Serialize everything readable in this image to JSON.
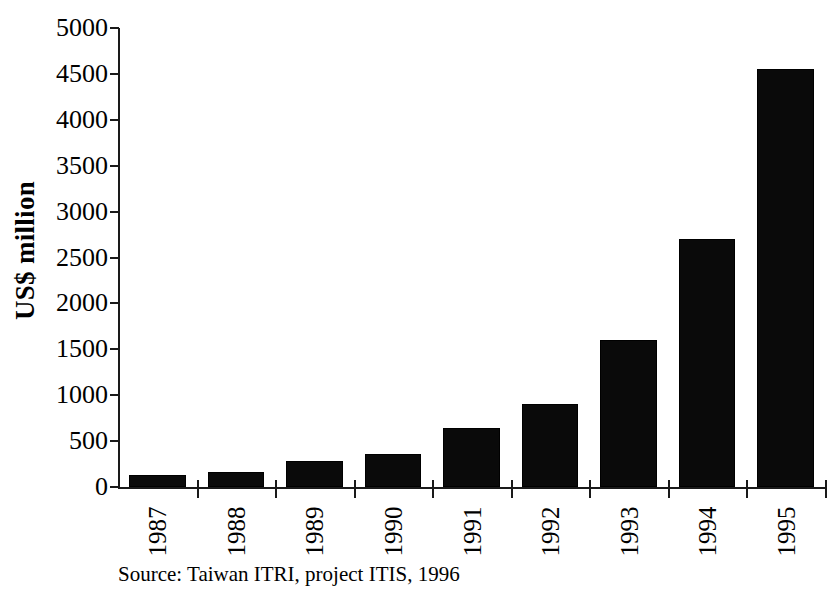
{
  "chart_data": {
    "type": "bar",
    "title": "",
    "subtitle": "",
    "xlabel": "",
    "ylabel": "US$ million",
    "categories": [
      "1987",
      "1988",
      "1989",
      "1990",
      "1991",
      "1992",
      "1993",
      "1994",
      "1995"
    ],
    "values": [
      130,
      165,
      285,
      360,
      645,
      900,
      1600,
      2700,
      4550
    ],
    "series": [
      {
        "name": "",
        "values": [
          130,
          165,
          285,
          360,
          645,
          900,
          1600,
          2700,
          4550
        ]
      }
    ],
    "ylim": [
      0,
      5000
    ],
    "ytick_values": [
      0,
      500,
      1000,
      1500,
      2000,
      2500,
      3000,
      3500,
      4000,
      4500,
      5000
    ],
    "ytick_labels": [
      "0",
      "500",
      "1000",
      "1500",
      "2000",
      "2500",
      "3000",
      "3500",
      "4000",
      "4500",
      "5000"
    ],
    "grid": false,
    "legend": false,
    "legend_position": "none",
    "bar_color": "#0a0a0a",
    "axis_color": "#1a1a1a",
    "annotations": [
      "Source: Taiwan ITRI, project ITIS, 1996"
    ]
  },
  "axes": {
    "y_title": "US$ million"
  },
  "footer": {
    "source": "Source: Taiwan ITRI, project ITIS, 1996"
  }
}
